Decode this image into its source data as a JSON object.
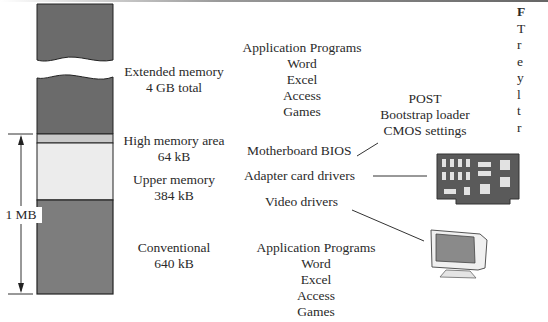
{
  "memory_map": {
    "extended": {
      "name": "Extended memory",
      "size": "4 GB total",
      "color": "#6b6b6b"
    },
    "high_memory_area": {
      "name": "High memory area",
      "size": "64 kB",
      "color": "#c9c9c9"
    },
    "upper": {
      "name": "Upper memory",
      "size": "384 kB",
      "color": "#ececec"
    },
    "conventional": {
      "name": "Conventional",
      "size": "640 kB",
      "color": "#7d7d7d"
    },
    "dimension_label": "1 MB"
  },
  "contents": {
    "extended_apps": {
      "title": "Application Programs",
      "items": [
        "Word",
        "Excel",
        "Access",
        "Games"
      ]
    },
    "bios_contents": {
      "items": [
        "POST",
        "Bootstrap loader",
        "CMOS settings"
      ]
    },
    "motherboard_bios": "Motherboard BIOS",
    "adapter_drivers": "Adapter card drivers",
    "video_drivers": "Video drivers",
    "conventional_apps": {
      "title": "Application Programs",
      "items": [
        "Word",
        "Excel",
        "Access",
        "Games"
      ]
    }
  },
  "margin_text": [
    "F",
    "T",
    "r",
    "e",
    "y",
    "l",
    "t",
    "r"
  ]
}
